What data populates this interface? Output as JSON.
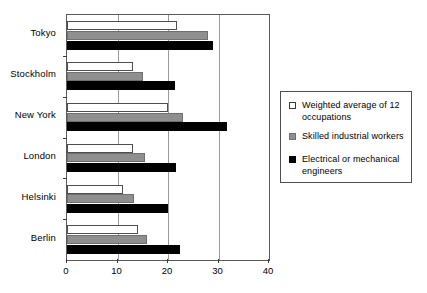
{
  "chart_data": {
    "type": "bar",
    "orientation": "horizontal",
    "title": "",
    "xlabel": "",
    "ylabel": "",
    "xlim": [
      0,
      40
    ],
    "xticks": [
      0,
      10,
      20,
      30,
      40
    ],
    "grid": true,
    "grid_axis": "x",
    "legend_position": "right",
    "categories": [
      "Tokyo",
      "Stockholm",
      "New York",
      "London",
      "Helsinki",
      "Berlin"
    ],
    "series": [
      {
        "name": "Weighted average of 12 occupations",
        "color": "#ffffff",
        "values": [
          21.8,
          13.0,
          20.0,
          13.0,
          11.0,
          14.0
        ]
      },
      {
        "name": "Skilled industrial workers",
        "color": "#8f8f8f",
        "values": [
          28.0,
          15.0,
          23.0,
          15.5,
          13.3,
          15.8
        ]
      },
      {
        "name": "Electrical or mechanical engineers",
        "color": "#000000",
        "values": [
          29.0,
          21.3,
          31.7,
          21.5,
          20.0,
          22.4
        ]
      }
    ]
  },
  "legend": {
    "entries": [
      {
        "label": "Weighted average of 12 occupations",
        "swatch": "open-square-icon"
      },
      {
        "label": "Skilled industrial workers",
        "swatch": "gray-square-icon"
      },
      {
        "label": "Electrical or mechanical engineers",
        "swatch": "black-square-icon"
      }
    ]
  },
  "axis": {
    "x_tick_labels": [
      "0",
      "10",
      "20",
      "30",
      "40"
    ],
    "y_tick_labels": [
      "Tokyo",
      "Stockholm",
      "New York",
      "London",
      "Helsinki",
      "Berlin"
    ]
  }
}
